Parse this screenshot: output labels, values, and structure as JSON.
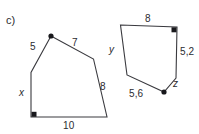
{
  "exercise": {
    "part_label": "c)"
  },
  "figures": [
    {
      "id": "left-pentagon",
      "name": "left-pentagon",
      "vertices": [
        {
          "name": "apex",
          "x": 51,
          "y": 36,
          "marker": "dot"
        },
        {
          "name": "upper-right-bend",
          "x": 93.5,
          "y": 59,
          "marker": "none"
        },
        {
          "name": "bottom-right",
          "x": 107,
          "y": 117,
          "marker": "none"
        },
        {
          "name": "bottom-left",
          "x": 31,
          "y": 117,
          "marker": "right-angle"
        },
        {
          "name": "left-upper",
          "x": 31,
          "y": 72.5,
          "marker": "none"
        }
      ],
      "right_angle": {
        "x": 31,
        "y": 117,
        "orientation": "up-right",
        "size": 5
      },
      "labels": [
        {
          "name": "side-5",
          "text": "5",
          "x": 30,
          "y": 41,
          "italic": false
        },
        {
          "name": "side-7",
          "text": "7",
          "x": 72,
          "y": 37,
          "italic": false
        },
        {
          "name": "side-8",
          "text": "8",
          "x": 100,
          "y": 81,
          "italic": false
        },
        {
          "name": "side-x",
          "text": "x",
          "x": 19,
          "y": 87,
          "italic": true
        },
        {
          "name": "side-10",
          "text": "10",
          "x": 63,
          "y": 120,
          "italic": false
        }
      ]
    },
    {
      "id": "right-pentagon",
      "name": "right-pentagon",
      "vertices": [
        {
          "name": "top-left",
          "x": 120.5,
          "y": 25,
          "marker": "none"
        },
        {
          "name": "top-right",
          "x": 177,
          "y": 27,
          "marker": "right-angle"
        },
        {
          "name": "right-lower",
          "x": 176,
          "y": 78,
          "marker": "none"
        },
        {
          "name": "bottom",
          "x": 164,
          "y": 92,
          "marker": "dot"
        },
        {
          "name": "left-bend",
          "x": 127,
          "y": 75,
          "marker": "none"
        }
      ],
      "right_angle": {
        "x": 177,
        "y": 27,
        "orientation": "down-left",
        "size": 5
      },
      "labels": [
        {
          "name": "side-8",
          "text": "8",
          "x": 145,
          "y": 13,
          "italic": false
        },
        {
          "name": "side-5-2",
          "text": "5,2",
          "x": 180,
          "y": 46,
          "italic": false
        },
        {
          "name": "side-z",
          "text": "z",
          "x": 173,
          "y": 78,
          "italic": true
        },
        {
          "name": "side-5-6",
          "text": "5,6",
          "x": 129,
          "y": 88,
          "italic": false
        },
        {
          "name": "side-y",
          "text": "y",
          "x": 109,
          "y": 44,
          "italic": true
        }
      ]
    }
  ],
  "colors": {
    "stroke": "#3a3a3f",
    "marker": "#18181c",
    "text": "#2b2b30",
    "background": "#ffffff"
  }
}
